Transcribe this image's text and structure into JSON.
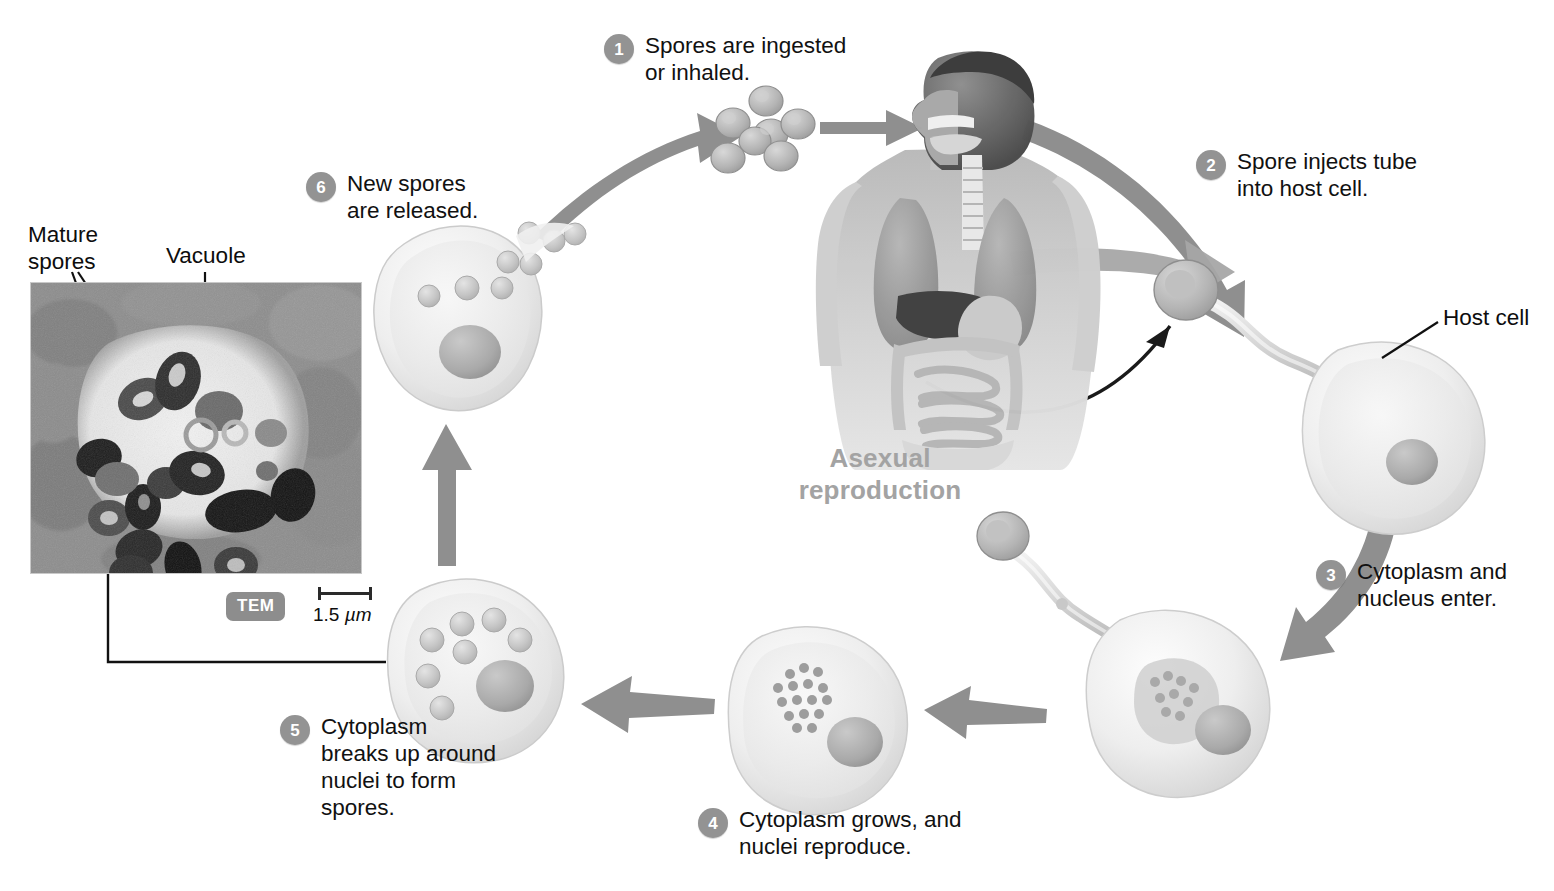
{
  "figure": {
    "center_title": "Asexual\nreproduction"
  },
  "steps": [
    {
      "num": "1",
      "text": "Spores are ingested\nor inhaled."
    },
    {
      "num": "2",
      "text": "Spore injects tube\ninto host cell."
    },
    {
      "num": "3",
      "text": "Cytoplasm and\nnucleus enter."
    },
    {
      "num": "4",
      "text": "Cytoplasm grows, and\nnuclei reproduce."
    },
    {
      "num": "5",
      "text": "Cytoplasm\nbreaks up around\nnuclei to form\nspores."
    },
    {
      "num": "6",
      "text": "New spores\nare released."
    }
  ],
  "labels": {
    "host_cell": "Host cell",
    "mature_spores": "Mature\nspores",
    "vacuole": "Vacuole"
  },
  "micrograph": {
    "technique_badge": "TEM",
    "scale_value": "1.5",
    "scale_unit": "µm"
  },
  "colors": {
    "step_badge": "#939393",
    "title_gray": "#a3a3a3",
    "arrow_gray": "#8f8f8f",
    "text_black": "#0d0d0d",
    "badge_gray": "#8d8d8d",
    "cell_fill": "#ededed",
    "nucleus_gray": "#b0b0b0"
  }
}
